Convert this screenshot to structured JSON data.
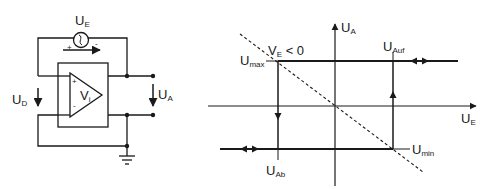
{
  "circuit": {
    "source_label": {
      "main": "U",
      "sub": "E"
    },
    "diff_voltage_label": {
      "main": "U",
      "sub": "D"
    },
    "output_voltage_label": {
      "main": "U",
      "sub": "A"
    },
    "amplifier_label": {
      "main": "V",
      "sub": "i"
    },
    "source_plus": "+",
    "source_minus": "-",
    "opamp_plus": "+",
    "opamp_minus": "-",
    "source_symbol": "S"
  },
  "graph": {
    "y_axis_label": {
      "main": "U",
      "sub": "A"
    },
    "x_axis_label": {
      "main": "U",
      "sub": "E"
    },
    "umax_label": {
      "main": "U",
      "sub": "max"
    },
    "umin_label": {
      "main": "U",
      "sub": "min"
    },
    "uab_label": {
      "main": "U",
      "sub": "Ab"
    },
    "uauf_label": {
      "main": "U",
      "sub": "Auf"
    },
    "ve_label": {
      "main": "V",
      "sub": "E",
      "rest": " < 0"
    }
  },
  "colors": {
    "line": "#1a1a1a",
    "background": "#ffffff"
  }
}
